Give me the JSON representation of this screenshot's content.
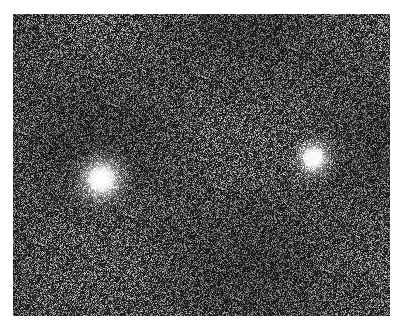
{
  "image": {
    "description": "Grainy black-and-white astronomical photograph showing two bright diffuse star-like objects against a noisy star field",
    "frame": {
      "x": 13,
      "y": 14,
      "width": 377,
      "height": 302
    },
    "background_color": "#2a2a2a",
    "border_color": "#ffffff",
    "objects": [
      {
        "name": "left-bright-object",
        "cx": 88,
        "cy": 165,
        "radius": 13,
        "color": "#ffffff"
      },
      {
        "name": "right-bright-object",
        "cx": 300,
        "cy": 144,
        "radius": 10,
        "color": "#f4f4f4"
      }
    ]
  }
}
